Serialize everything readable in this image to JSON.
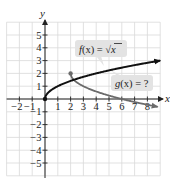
{
  "chart_data": {
    "type": "line",
    "title": "",
    "xlabel": "x",
    "ylabel": "y",
    "xlim": [
      -3,
      9
    ],
    "ylim": [
      -6,
      6
    ],
    "grid": true,
    "x_tick_labels": [
      "−2",
      "−1",
      "1",
      "2",
      "3",
      "4",
      "5",
      "6",
      "7",
      "8"
    ],
    "x_ticks": [
      -2,
      -1,
      1,
      2,
      3,
      4,
      5,
      6,
      7,
      8
    ],
    "y_tick_labels": [
      "5",
      "4",
      "3",
      "2",
      "1",
      "−1",
      "−2",
      "−3",
      "−4",
      "−5"
    ],
    "y_ticks": [
      5,
      4,
      3,
      2,
      1,
      -1,
      -2,
      -3,
      -4,
      -5
    ],
    "series": [
      {
        "name": "f(x) = √x",
        "color": "#111111",
        "start_point": [
          0,
          0
        ],
        "x": [
          0,
          0.25,
          1,
          2,
          4,
          6,
          9
        ],
        "y": [
          0,
          0.5,
          1,
          1.41,
          2,
          2.45,
          3
        ],
        "arrow_end": true
      },
      {
        "name": "g(x) = ?",
        "color": "#6b6b6b",
        "start_point": [
          2,
          2
        ],
        "x": [
          2,
          2.25,
          3,
          4,
          6,
          8,
          8.8
        ],
        "y": [
          2,
          1.5,
          1,
          0.59,
          0,
          -0.45,
          -0.61
        ],
        "arrow_end": true
      }
    ],
    "annotations": [
      {
        "text": "f(x) = √x",
        "points_to": "f"
      },
      {
        "text": "g(x) = ?",
        "points_to": "g"
      }
    ]
  },
  "labels": {
    "x_axis": "x",
    "y_axis": "y",
    "f_label": {
      "fn": "f",
      "arg": "(x)",
      "eq": " = ",
      "rad": "√",
      "radicand": "x"
    },
    "g_label": {
      "fn": "g",
      "arg": "(x)",
      "eq": " = ?"
    }
  },
  "colors": {
    "grid": "#d9d9d9",
    "axis": "#222222",
    "f_curve": "#111111",
    "g_curve": "#6b6b6b",
    "label_bg": "#e3e3e3"
  }
}
